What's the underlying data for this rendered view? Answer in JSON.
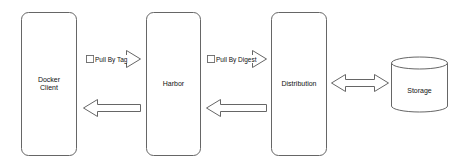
{
  "diagram": {
    "type": "architecture-flow",
    "nodes": [
      {
        "id": "docker-client",
        "label_line1": "Docker",
        "label_line2": "Client",
        "shape": "rounded-rectangle"
      },
      {
        "id": "harbor",
        "label": "Harbor",
        "shape": "rounded-rectangle"
      },
      {
        "id": "distribution",
        "label": "Distribution",
        "shape": "rounded-rectangle"
      },
      {
        "id": "storage",
        "label": "Storage",
        "shape": "cylinder"
      }
    ],
    "edges": [
      {
        "from": "docker-client",
        "to": "harbor",
        "label": "Pull By Tag",
        "direction": "right"
      },
      {
        "from": "harbor",
        "to": "docker-client",
        "label": "",
        "direction": "left"
      },
      {
        "from": "harbor",
        "to": "distribution",
        "label": "Pull By Digest",
        "direction": "right"
      },
      {
        "from": "distribution",
        "to": "harbor",
        "label": "",
        "direction": "left"
      },
      {
        "from": "distribution",
        "to": "storage",
        "label": "",
        "direction": "bidirectional"
      }
    ],
    "colors": {
      "stroke": "#666666",
      "fill": "#ffffff",
      "text": "#111111"
    }
  }
}
